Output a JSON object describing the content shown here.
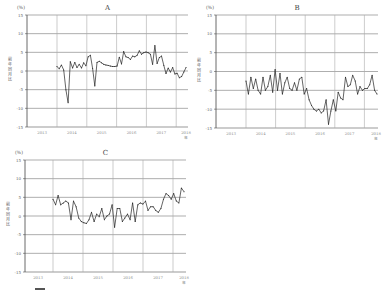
{
  "chart_data": [
    {
      "type": "line",
      "title": "A",
      "unit_label": "(%)",
      "ylabel": "前年同月比",
      "xlabel": "年",
      "ylim": [
        -15,
        15
      ],
      "yticks": [
        15,
        10,
        5,
        0,
        -5,
        -10,
        -15
      ],
      "xticks": [
        "2013",
        "2014",
        "2015",
        "2016",
        "2017",
        "2018"
      ],
      "grid": true,
      "x_start": "2013-07",
      "x_end": "2018-02",
      "series": [
        {
          "name": "A",
          "values": [
            1.2,
            0.6,
            1.6,
            0.3,
            -5.0,
            -8.5,
            2.5,
            0.8,
            2.3,
            0.9,
            1.8,
            0.8,
            2.2,
            1.4,
            3.8,
            4.2,
            0.7,
            -4.0,
            2.3,
            2.6,
            2.2,
            1.8,
            1.6,
            1.5,
            1.3,
            1.2,
            1.2,
            1.3,
            3.7,
            1.9,
            5.2,
            3.8,
            3.6,
            3.1,
            4.0,
            3.8,
            4.2,
            5.4,
            4.5,
            4.9,
            5.1,
            4.9,
            4.5,
            1.8,
            6.8,
            2.0,
            3.6,
            4.0,
            1.5,
            -0.7,
            0.8,
            -0.3,
            0.9,
            -0.8,
            -0.6,
            -1.8,
            -1.5,
            -0.3,
            0.9
          ]
        }
      ]
    },
    {
      "type": "line",
      "title": "B",
      "unit_label": "(%)",
      "ylabel": "前年同月比",
      "xlabel": "年",
      "ylim": [
        -15,
        15
      ],
      "yticks": [
        15,
        10,
        5,
        0,
        -5,
        -10,
        -15
      ],
      "xticks": [
        "2013",
        "2014",
        "2015",
        "2016",
        "2017",
        "2018"
      ],
      "grid": true,
      "x_start": "2013-07",
      "x_end": "2018-02",
      "series": [
        {
          "name": "B",
          "values": [
            -2.5,
            -6.0,
            -1.5,
            -4.5,
            -2.0,
            -5.0,
            -6.0,
            -1.5,
            -5.0,
            -4.0,
            -1.0,
            -5.5,
            0.5,
            -5.0,
            -0.5,
            -6.0,
            -3.0,
            -1.5,
            -4.5,
            -5.0,
            -3.0,
            -5.0,
            -2.0,
            -1.5,
            -6.0,
            -4.5,
            -7.5,
            -9.0,
            -10.0,
            -10.5,
            -10.0,
            -11.0,
            -10.5,
            -7.5,
            -14.0,
            -10.5,
            -7.5,
            -10.5,
            -5.5,
            -7.0,
            -7.5,
            -1.5,
            -4.0,
            -3.5,
            -1.0,
            -2.5,
            -6.0,
            -4.0,
            -5.0,
            -4.5,
            -4.5,
            -3.5,
            -1.0,
            -5.0,
            -6.0
          ]
        }
      ]
    },
    {
      "type": "line",
      "title": "C",
      "unit_label": "(%)",
      "ylabel": "前年同月比",
      "xlabel": "年",
      "ylim": [
        -15,
        15
      ],
      "yticks": [
        15,
        10,
        5,
        0,
        -5,
        -10,
        -15
      ],
      "xticks": [
        "2013",
        "2014",
        "2015",
        "2016",
        "2017",
        "2018"
      ],
      "grid": true,
      "x_start": "2013-07",
      "x_end": "2018-02",
      "series": [
        {
          "name": "C",
          "values": [
            4.5,
            3.0,
            5.5,
            3.0,
            3.5,
            4.0,
            3.5,
            -1.0,
            4.0,
            2.5,
            -0.5,
            -1.5,
            -1.8,
            -2.0,
            -1.0,
            1.0,
            -1.5,
            0.5,
            -0.2,
            2.0,
            -1.0,
            0.0,
            0.5,
            3.0,
            -3.0,
            2.0,
            2.0,
            -1.5,
            -0.5,
            0.5,
            -1.0,
            3.5,
            -1.5,
            3.0,
            3.5,
            3.2,
            4.0,
            1.5,
            2.5,
            2.5,
            1.5,
            1.0,
            2.0,
            4.5,
            6.0,
            5.5,
            4.5,
            6.0,
            4.0,
            3.5,
            7.5,
            6.5
          ]
        }
      ]
    }
  ],
  "legend_hint": {
    "fragments": [
      "",
      "",
      ""
    ]
  }
}
